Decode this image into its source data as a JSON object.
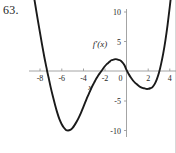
{
  "figure": {
    "problem_number": "63.",
    "function_label": "f'(x)",
    "x_axis_name": "x",
    "curve_color": "#1a1a1a",
    "axis_color": "#9a9a9a"
  },
  "chart_data": {
    "type": "line",
    "title": "",
    "subtitle": "",
    "xlabel": "x",
    "ylabel": "",
    "legend": [
      "f'(x)"
    ],
    "legend_position": "inside-upper-left-of-y-axis",
    "grid": false,
    "xlim": [
      -8.8,
      4.6
    ],
    "ylim": [
      -11.5,
      11.0
    ],
    "xticks": [
      -8,
      -6,
      -4,
      -2,
      0,
      2,
      4
    ],
    "xtick_labels": [
      "-8",
      "-6",
      "-4",
      "-2",
      "0",
      "2",
      "4"
    ],
    "yticks": [
      -10,
      -5,
      5,
      10
    ],
    "ytick_labels": [
      "-10",
      "-5",
      "5",
      "10"
    ],
    "annotations": [
      "f'(x)"
    ],
    "series": [
      {
        "name": "f'(x)",
        "x": [
          -8.6,
          -8.4,
          -8.2,
          -8.0,
          -7.8,
          -7.6,
          -7.4,
          -7.3,
          -7.2,
          -7.0,
          -6.8,
          -6.6,
          -6.4,
          -6.2,
          -6.0,
          -5.8,
          -5.6,
          -5.4,
          -5.2,
          -5.0,
          -4.8,
          -4.6,
          -4.4,
          -4.2,
          -4.0,
          -3.8,
          -3.6,
          -3.4,
          -3.2,
          -3.0,
          -2.8,
          -2.6,
          -2.4,
          -2.2,
          -2.0,
          -1.8,
          -1.6,
          -1.4,
          -1.2,
          -1.0,
          -0.8,
          -0.6,
          -0.4,
          -0.2,
          0.0,
          0.2,
          0.4,
          0.6,
          0.8,
          1.0,
          1.2,
          1.4,
          1.6,
          1.8,
          2.0,
          2.2,
          2.4,
          2.6,
          2.8,
          3.0,
          3.2,
          3.4,
          3.6,
          3.8,
          4.0,
          4.2,
          4.4
        ],
        "y": [
          13.0,
          10.8,
          8.6,
          6.5,
          4.4,
          2.4,
          0.6,
          -0.3,
          -1.1,
          -2.8,
          -4.3,
          -5.7,
          -7.0,
          -8.1,
          -8.9,
          -9.5,
          -9.9,
          -10.0,
          -9.9,
          -9.6,
          -9.1,
          -8.5,
          -7.8,
          -7.0,
          -6.1,
          -5.2,
          -4.3,
          -3.5,
          -2.7,
          -2.0,
          -1.3,
          -0.7,
          -0.2,
          0.3,
          0.8,
          1.2,
          1.5,
          1.8,
          1.9,
          2.0,
          1.9,
          1.8,
          1.5,
          1.0,
          0.2,
          -0.5,
          -1.1,
          -1.6,
          -2.0,
          -2.3,
          -2.6,
          -2.8,
          -2.9,
          -3.0,
          -3.0,
          -2.9,
          -2.7,
          -2.2,
          -1.4,
          -0.3,
          1.2,
          3.0,
          5.2,
          7.8,
          10.8,
          14.0,
          17.5
        ]
      }
    ]
  }
}
